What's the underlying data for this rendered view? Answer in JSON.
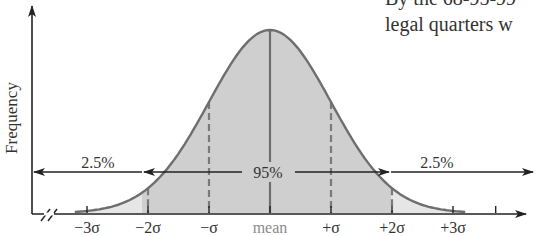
{
  "page_text": {
    "line1": "By the 68-95-99",
    "line2": "legal quarters w"
  },
  "chart_data": {
    "type": "area",
    "title": "",
    "xlabel": "",
    "ylabel": "Frequency",
    "x_ticks": [
      "−3σ",
      "−2σ",
      "−σ",
      "mean",
      "+σ",
      "+2σ",
      "+3σ"
    ],
    "x_tick_values": [
      -3,
      -2,
      -1,
      0,
      1,
      2,
      3
    ],
    "dashed_lines_at": [
      -2,
      -1,
      1,
      2
    ],
    "solid_line_at": 0,
    "regions": [
      {
        "label": "2.5%",
        "from": "-inf",
        "to": -2,
        "fill": "#e6e6e6"
      },
      {
        "label": "95%",
        "from": -2,
        "to": 2,
        "fill": "#cfcfcf"
      },
      {
        "label": "2.5%",
        "from": 2,
        "to": "inf",
        "fill": "#e6e6e6"
      }
    ],
    "annotations": [
      "2.5%",
      "95%",
      "2.5%"
    ],
    "axis_break": true,
    "grid": false,
    "colors": {
      "curve": "#6e6e6e",
      "center_fill": "#cfcfcf",
      "tail_fill": "#e6e6e6",
      "axis": "#222222",
      "mean_label": "#8a8a8a",
      "text": "#333333"
    }
  }
}
